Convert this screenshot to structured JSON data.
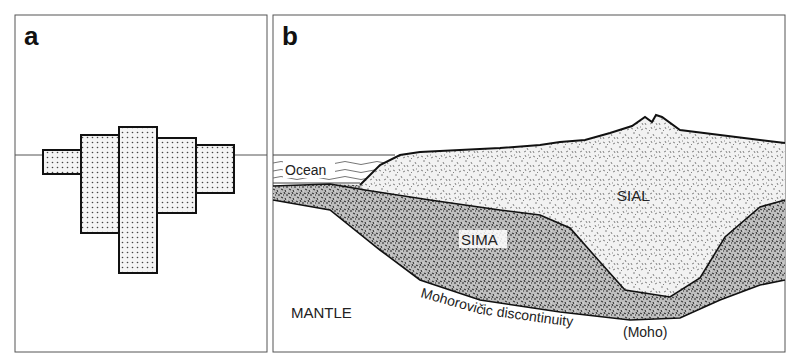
{
  "figure": {
    "panel_a": {
      "letter": "a",
      "description": "Blocks of differing heights floating at a common waterline (isostasy analogy)",
      "blocks": [
        {
          "x": 43,
          "top": 150,
          "bottom": 174,
          "width": 38
        },
        {
          "x": 81,
          "top": 135,
          "bottom": 233,
          "width": 38
        },
        {
          "x": 119,
          "top": 127,
          "bottom": 273,
          "width": 38
        },
        {
          "x": 157,
          "top": 138,
          "bottom": 213,
          "width": 39
        },
        {
          "x": 196,
          "top": 145,
          "bottom": 193,
          "width": 38
        }
      ],
      "waterline_y": 155
    },
    "panel_b": {
      "letter": "b",
      "labels": {
        "ocean": "Ocean",
        "sial": "SIAL",
        "sima": "SIMA",
        "mantle": "MANTLE",
        "moho": "Mohorovičic discontinuity",
        "moho_abbr": "(Moho)"
      }
    },
    "colors": {
      "line": "#111111",
      "frame": "#555555",
      "background": "#ffffff"
    }
  }
}
